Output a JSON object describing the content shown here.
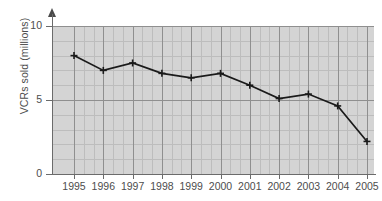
{
  "chart_data": {
    "type": "line",
    "title": "",
    "xlabel": "",
    "ylabel": "VCRs sold (millions)",
    "categories": [
      "1995",
      "1996",
      "1997",
      "1998",
      "1999",
      "2000",
      "2001",
      "2002",
      "2003",
      "2004",
      "2005"
    ],
    "values": [
      8.0,
      7.0,
      7.5,
      6.8,
      6.5,
      6.8,
      6.0,
      5.1,
      5.4,
      4.6,
      2.2
    ],
    "series": [
      {
        "name": "VCRs sold",
        "values": [
          8.0,
          7.0,
          7.5,
          6.8,
          6.5,
          6.8,
          6.0,
          5.1,
          5.4,
          4.6,
          2.2
        ]
      }
    ],
    "ylim": [
      0,
      10
    ],
    "y_ticks": [
      "0",
      "5",
      "10"
    ],
    "y_tick_values": [
      0,
      5,
      10
    ],
    "grid": true,
    "grid_minor": true,
    "legend": false,
    "legend_position": "none",
    "marker": "plus",
    "line_color": "#1a1a1a",
    "plot_background": "#d4d4d4",
    "grid_color": "#8f8f8f",
    "grid_minor_color": "#bdbdbd",
    "axis_color": "#6b6b6b",
    "text_color": "#4d4d4d"
  }
}
